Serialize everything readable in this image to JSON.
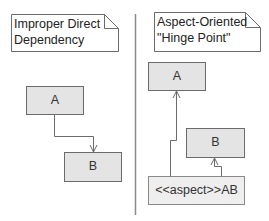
{
  "left_panel": {
    "note": {
      "line1": "Improper Direct",
      "line2": "Dependency"
    },
    "class_a": {
      "label": "A"
    },
    "class_b": {
      "label": "B"
    },
    "relation": "A depends on B"
  },
  "right_panel": {
    "note": {
      "line1": "Aspect-Oriented",
      "line2": "\"Hinge Point\""
    },
    "class_a": {
      "label": "A"
    },
    "class_b": {
      "label": "B"
    },
    "aspect": {
      "label": "<<aspect>>AB"
    },
    "relations": [
      "AB depends on A",
      "AB depends on B"
    ]
  },
  "colors": {
    "box_fill": "#e4e4e4",
    "aspect_fill": "#eeeeee",
    "stroke": "#6b6b6b",
    "divider": "#8a8a8a",
    "note_fill": "#ffffff"
  }
}
